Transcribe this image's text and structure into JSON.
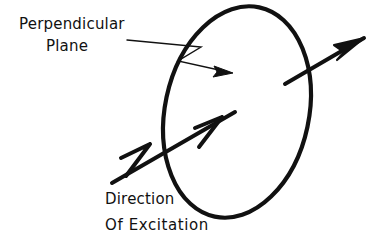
{
  "figure": {
    "background_color": "#ffffff",
    "ink_color": "#111111"
  },
  "labels": {
    "perpendicular": "Perpendicular",
    "plane": "Plane",
    "direction": "Direction",
    "of_excitation": "Of Excitation"
  },
  "shapes": {
    "plane_ellipse": {
      "name": "perpendicular-plane-ellipse",
      "center_x": 237,
      "center_y": 112,
      "radius_x": 72,
      "radius_y": 107,
      "rotation_deg": 12,
      "stroke_width": 4,
      "stroke_color": "#111111",
      "fill": "none"
    },
    "excitation_arrow": {
      "name": "direction-of-excitation-arrow",
      "from_x": 112,
      "from_y": 183,
      "to_x": 235,
      "to_y": 112,
      "stroke_width": 4,
      "arrowheads": 2
    },
    "emission_arrow": {
      "name": "emission-arrow",
      "from_x": 285,
      "from_y": 84,
      "to_x": 366,
      "to_y": 37,
      "stroke_width": 4,
      "arrowheads": 1
    },
    "leader_line": {
      "name": "perpendicular-plane-leader-line",
      "from_x": 127,
      "from_y": 40,
      "zigzag_points": "127,40 201,47 178,61 232,73",
      "stroke_width": 1.3,
      "arrowheads": 1
    }
  }
}
